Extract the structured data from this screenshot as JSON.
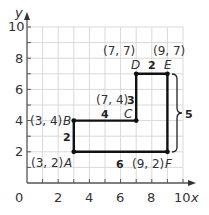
{
  "graph": {
    "axes": {
      "x_label": "x",
      "y_label": "y",
      "origin_label": "0",
      "x_ticks": [
        "2",
        "4",
        "6",
        "8",
        "10"
      ],
      "y_ticks": [
        "2",
        "4",
        "6",
        "8",
        "10"
      ],
      "range": [
        0,
        10
      ]
    },
    "points": [
      {
        "name": "A",
        "coord": "(3, 2)",
        "x": 3,
        "y": 2
      },
      {
        "name": "B",
        "coord": "(3, 4)",
        "x": 3,
        "y": 4
      },
      {
        "name": "C",
        "coord": "(7, 4)",
        "x": 7,
        "y": 4
      },
      {
        "name": "D",
        "coord": "(7, 7)",
        "x": 7,
        "y": 7
      },
      {
        "name": "E",
        "coord": "(9, 7)",
        "x": 9,
        "y": 7
      },
      {
        "name": "F",
        "coord": "(9, 2)",
        "x": 9,
        "y": 2
      }
    ],
    "side_lengths": {
      "AB": "2",
      "BC": "4",
      "CD": "3",
      "DE": "2",
      "EF": "5",
      "AF": "6"
    },
    "colors": {
      "grid": "#d9d9d9",
      "axis": "#555555",
      "figure": "#111111"
    }
  }
}
